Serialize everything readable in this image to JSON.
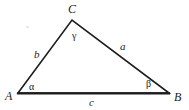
{
  "figure": {
    "background_color": "#ffffff",
    "stroke_color": "#1c1c1c",
    "text_color": "#1c1c1c"
  },
  "vertices": [
    {
      "id": "A",
      "label": "A",
      "x": 18,
      "y": 93
    },
    {
      "id": "B",
      "label": "B",
      "x": 169,
      "y": 93
    },
    {
      "id": "C",
      "label": "C",
      "x": 72,
      "y": 20
    }
  ],
  "sides": [
    {
      "id": "a",
      "label": "a",
      "from": "B",
      "to": "C"
    },
    {
      "id": "b",
      "label": "b",
      "from": "A",
      "to": "C"
    },
    {
      "id": "c",
      "label": "c",
      "from": "A",
      "to": "B"
    }
  ],
  "angles": [
    {
      "id": "alpha",
      "label": "α",
      "at": "A"
    },
    {
      "id": "beta",
      "label": "β",
      "at": "B"
    },
    {
      "id": "gamma",
      "label": "γ",
      "at": "C"
    }
  ]
}
